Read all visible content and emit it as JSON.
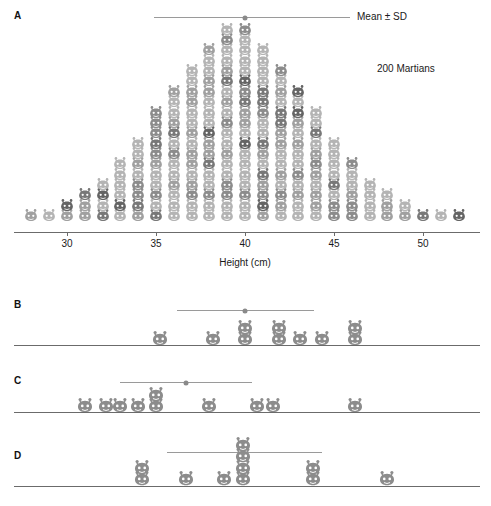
{
  "figure": {
    "organism_icon": "martian-icon",
    "icon_colors": [
      "#b4b4b4",
      "#a0a0a0",
      "#8c8c8c",
      "#787878",
      "#646464"
    ]
  },
  "panels": [
    {
      "letter": "A",
      "annotations": [
        {
          "name": "mean-sd-label",
          "text": "Mean ± SD"
        },
        {
          "name": "sample-size-label",
          "text": "200 Martians"
        }
      ],
      "error_bar": {
        "mean": 40.0,
        "sd_low": 34.9,
        "sd_high": 45.9
      },
      "axis": {
        "label": "Height (cm)",
        "min": 27.0,
        "max": 53.2,
        "ticks": [
          30,
          35,
          40,
          45,
          50
        ],
        "tick_labels": [
          "30",
          "35",
          "40",
          "45",
          "50"
        ]
      }
    },
    {
      "letter": "B",
      "error_bar": {
        "mean": 40.0,
        "sd_low": 36.2,
        "sd_high": 43.9
      },
      "axis": {
        "min": 27.0,
        "max": 53.2
      }
    },
    {
      "letter": "C",
      "error_bar": {
        "mean": 36.7,
        "sd_low": 33.0,
        "sd_high": 40.4
      },
      "axis": {
        "min": 27.0,
        "max": 53.2
      }
    },
    {
      "letter": "D",
      "error_bar": {
        "mean": 39.9,
        "sd_low": 35.6,
        "sd_high": 44.3
      },
      "axis": {
        "min": 27.0,
        "max": 53.2
      }
    }
  ],
  "chart_data": {
    "type": "scatter",
    "title": "",
    "xlabel": "Height (cm)",
    "ylabel": "",
    "xlim": [
      27.0,
      53.2
    ],
    "grid": false,
    "legend": "none",
    "units": "cm",
    "panel_A": {
      "name": "200 Martians dot histogram",
      "n": 200,
      "bin_width": 1,
      "categories": [
        28,
        29,
        30,
        31,
        32,
        33,
        34,
        35,
        36,
        37,
        38,
        39,
        40,
        41,
        42,
        43,
        44,
        45,
        46,
        47,
        48,
        49,
        50,
        51,
        52
      ],
      "values": [
        1,
        1,
        2,
        3,
        4,
        6,
        8,
        11,
        13,
        15,
        17,
        19,
        19,
        17,
        15,
        13,
        11,
        8,
        6,
        4,
        3,
        2,
        1,
        1,
        1
      ],
      "mean": 40.0,
      "sd": 5.0
    },
    "panel_B": {
      "name": "Sample B (n=10)",
      "n": 10,
      "values": [
        35.2,
        38.2,
        40.0,
        40.0,
        41.9,
        41.9,
        43.1,
        44.3,
        46.2,
        46.2
      ],
      "mean": 40.0,
      "sd": 3.8
    },
    "panel_C": {
      "name": "Sample C (n=10)",
      "n": 10,
      "values": [
        31.0,
        32.2,
        33.0,
        34.0,
        35.0,
        35.0,
        38.0,
        40.7,
        41.6,
        46.2
      ],
      "mean": 36.7,
      "sd": 3.7
    },
    "panel_D": {
      "name": "Sample D (n=10)",
      "n": 10,
      "values": [
        34.2,
        34.2,
        36.7,
        38.8,
        39.9,
        39.9,
        39.9,
        39.9,
        43.8,
        43.8,
        48.0
      ],
      "mean": 39.9,
      "sd": 4.4
    }
  }
}
